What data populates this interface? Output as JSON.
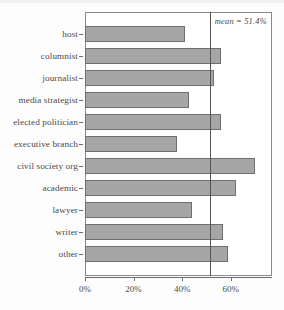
{
  "chart_data": {
    "type": "bar",
    "orientation": "horizontal",
    "title": "",
    "xlabel": "",
    "ylabel": "",
    "categories": [
      "host",
      "columnist",
      "journalist",
      "media strategist",
      "elected politician",
      "executive branch",
      "civil society org",
      "academic",
      "lawyer",
      "writer",
      "other"
    ],
    "values": [
      41,
      56,
      53,
      43,
      56,
      38,
      70,
      62,
      44,
      57,
      59
    ],
    "value_unit": "%",
    "xlim": [
      0,
      77
    ],
    "xticks": [
      0,
      20,
      40,
      60
    ],
    "xtick_labels": [
      "0%",
      "20%",
      "40%",
      "60%"
    ],
    "grid": false,
    "legend": null,
    "annotations": [
      {
        "name": "mean-reference-line",
        "text": "mean = 51.4%",
        "value": 51.4
      }
    ],
    "colors": {
      "bar_fill": "#a6a6a6",
      "bar_edge": "#6f6f6f",
      "axis": "#6d6d6d",
      "frame": "#8a8a8a",
      "mean_line": "#555555",
      "text": "#4a4a4a",
      "background": "#ffffff"
    }
  }
}
